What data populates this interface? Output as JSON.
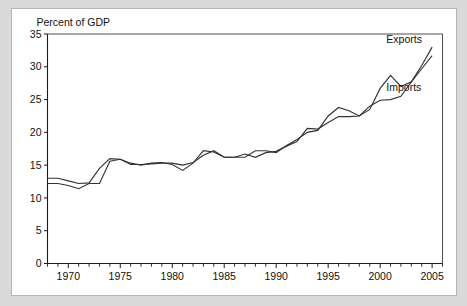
{
  "figure": {
    "background_color": "#d9d9d9",
    "card_color": "#ffffff",
    "border_color": "#b5b5b5",
    "line_color": "#333333",
    "axis_color": "#1a1a1a"
  },
  "chart_data": {
    "type": "line",
    "title": "",
    "subtitle": "",
    "ylabel": "Percent of GDP",
    "xlabel": "",
    "ylim": [
      0,
      35
    ],
    "xlim": [
      1968,
      2006
    ],
    "ytick_labels": [
      "0",
      "5",
      "10",
      "15",
      "20",
      "25",
      "30",
      "35"
    ],
    "yticks": [
      0,
      5,
      10,
      15,
      20,
      25,
      30,
      35
    ],
    "xtick_labels": [
      "1970",
      "1975",
      "1980",
      "1985",
      "1990",
      "1995",
      "2000",
      "2005"
    ],
    "xticks": [
      1970,
      1975,
      1980,
      1985,
      1990,
      1995,
      2000,
      2005
    ],
    "x_minor_tick_step": 1,
    "grid": false,
    "legend_position": "inline-right-annotations",
    "annotations": [
      {
        "text": "Exports",
        "x": 2000.6,
        "y": 33.6
      },
      {
        "text": "Imports",
        "x": 2000.6,
        "y": 26.3
      }
    ],
    "x": [
      1968,
      1969,
      1970,
      1971,
      1972,
      1973,
      1974,
      1975,
      1976,
      1977,
      1978,
      1979,
      1980,
      1981,
      1982,
      1983,
      1984,
      1985,
      1986,
      1987,
      1988,
      1989,
      1990,
      1991,
      1992,
      1993,
      1994,
      1995,
      1996,
      1997,
      1998,
      1999,
      2000,
      2001,
      2002,
      2003,
      2004,
      2005
    ],
    "series": [
      {
        "name": "Exports",
        "values": [
          13.0,
          13.0,
          12.6,
          12.2,
          12.3,
          14.5,
          16.0,
          15.9,
          15.3,
          15.0,
          15.3,
          15.4,
          15.1,
          14.2,
          15.3,
          17.2,
          17.0,
          16.2,
          16.2,
          16.2,
          17.2,
          17.2,
          16.9,
          18.0,
          18.9,
          20.0,
          20.3,
          22.5,
          23.8,
          23.3,
          22.5,
          23.5,
          26.7,
          28.7,
          27.0,
          27.7,
          30.2,
          33.0
        ]
      },
      {
        "name": "Imports",
        "values": [
          12.2,
          12.2,
          11.9,
          11.4,
          12.2,
          12.2,
          15.6,
          15.9,
          15.1,
          15.1,
          15.2,
          15.3,
          15.3,
          15.0,
          15.4,
          16.5,
          17.2,
          16.2,
          16.2,
          16.7,
          16.2,
          16.9,
          17.1,
          17.9,
          18.6,
          20.6,
          20.5,
          21.5,
          22.4,
          22.4,
          22.5,
          24.0,
          24.9,
          25.0,
          25.5,
          27.7,
          29.7,
          31.7
        ]
      }
    ]
  }
}
